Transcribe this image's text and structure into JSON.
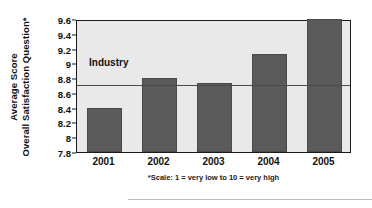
{
  "chart_data": {
    "type": "bar",
    "title": "",
    "xlabel": "",
    "ylabel_line1": "Average Score",
    "ylabel_line2": "Overall Satisfaction Question*",
    "categories": [
      "2001",
      "2002",
      "2003",
      "2004",
      "2005"
    ],
    "values": [
      8.4,
      8.8,
      8.74,
      9.12,
      9.6
    ],
    "ylim": [
      7.8,
      9.6
    ],
    "yticks": [
      "7.8",
      "8",
      "8.2",
      "8.4",
      "8.6",
      "8.8",
      "9",
      "9.2",
      "9.4",
      "9.6"
    ],
    "ytick_values": [
      7.8,
      8.0,
      8.2,
      8.4,
      8.6,
      8.8,
      9.0,
      9.2,
      9.4,
      9.6
    ],
    "grid": false,
    "legend": "none",
    "reference_line": {
      "label": "Industry",
      "value": 8.73
    },
    "footnote": "*Scale: 1 = very low to 10 = very high",
    "bar_color": "#5a5a5a",
    "plot_background": "#e9e9e9",
    "axis_color": "#1a1a1a"
  }
}
